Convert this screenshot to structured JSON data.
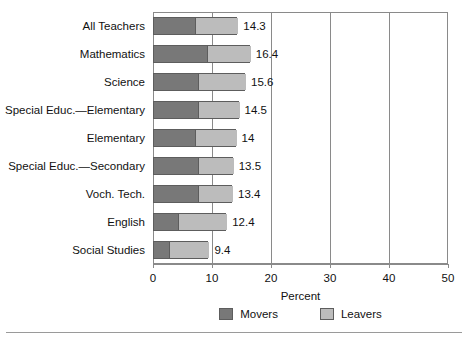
{
  "chart_data": {
    "type": "bar",
    "orientation": "horizontal",
    "stacked": true,
    "title": "",
    "xlabel": "Percent",
    "ylabel": "",
    "xlim": [
      0,
      50
    ],
    "xticks": [
      0,
      10,
      20,
      30,
      40,
      50
    ],
    "xtick_labels": [
      "0",
      "10",
      "20",
      "30",
      "40",
      "50"
    ],
    "grid": true,
    "legend_position": "bottom",
    "categories": [
      "All Teachers",
      "Mathematics",
      "Science",
      "Special Educ.—Elementary",
      "Elementary",
      "Special Educ.—Secondary",
      "Voch. Tech.",
      "English",
      "Social Studies"
    ],
    "series": [
      {
        "name": "Movers",
        "color": "#787878",
        "values": [
          6.9,
          9.0,
          7.4,
          7.4,
          7.0,
          7.4,
          7.4,
          4.1,
          2.6
        ]
      },
      {
        "name": "Leavers",
        "color": "#bcbcbc",
        "values": [
          7.4,
          7.4,
          8.2,
          7.1,
          7.0,
          6.1,
          6.0,
          8.3,
          6.8
        ]
      }
    ],
    "totals": [
      14.3,
      16.4,
      15.6,
      14.5,
      14,
      13.5,
      13.4,
      12.4,
      9.4
    ],
    "total_labels": [
      "14.3",
      "16.4",
      "15.6",
      "14.5",
      "14",
      "13.5",
      "13.4",
      "12.4",
      "9.4"
    ]
  }
}
